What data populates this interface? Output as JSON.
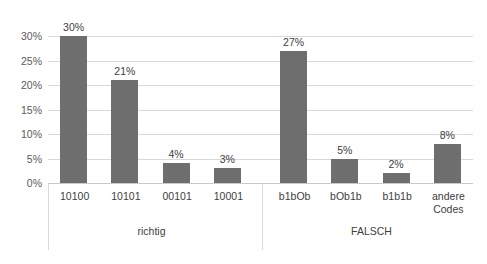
{
  "chart_data": {
    "type": "bar",
    "title": "",
    "subtitle": "",
    "xlabel": "",
    "ylabel": "",
    "ylim": [
      0,
      30
    ],
    "ytick_labels": [
      "0%",
      "5%",
      "10%",
      "15%",
      "20%",
      "25%",
      "30%"
    ],
    "ytick_values": [
      0,
      5,
      10,
      15,
      20,
      25,
      30
    ],
    "grid": true,
    "legend": false,
    "orientation": "vertical",
    "bar_color": "#6e6e6e",
    "gridline_color": "#d9d9d9",
    "categories": [
      "10100",
      "10101",
      "00101",
      "10001",
      "b1bOb",
      "bOb1b",
      "b1b1b",
      "andere Codes"
    ],
    "values": [
      30,
      21,
      4,
      3,
      27,
      5,
      2,
      8
    ],
    "data_labels": [
      "30%",
      "21%",
      "4%",
      "3%",
      "27%",
      "5%",
      "2%",
      "8%"
    ],
    "groups": [
      {
        "label": "richtig",
        "categories": [
          "10100",
          "10101",
          "00101",
          "10001"
        ]
      },
      {
        "label": "FALSCH",
        "categories": [
          "b1bOb",
          "bOb1b",
          "b1b1b",
          "andere Codes"
        ]
      }
    ],
    "bars": [
      {
        "category": "10100",
        "category_line1": "10100",
        "category_line2": "",
        "value": 30,
        "label": "30%",
        "group": "richtig"
      },
      {
        "category": "10101",
        "category_line1": "10101",
        "category_line2": "",
        "value": 21,
        "label": "21%",
        "group": "richtig"
      },
      {
        "category": "00101",
        "category_line1": "00101",
        "category_line2": "",
        "value": 4,
        "label": "4%",
        "group": "richtig"
      },
      {
        "category": "10001",
        "category_line1": "10001",
        "category_line2": "",
        "value": 3,
        "label": "3%",
        "group": "richtig"
      },
      {
        "category": "b1bOb",
        "category_line1": "b1bOb",
        "category_line2": "",
        "value": 27,
        "label": "27%",
        "group": "FALSCH"
      },
      {
        "category": "bOb1b",
        "category_line1": "bOb1b",
        "category_line2": "",
        "value": 5,
        "label": "5%",
        "group": "FALSCH"
      },
      {
        "category": "b1b1b",
        "category_line1": "b1b1b",
        "category_line2": "",
        "value": 2,
        "label": "2%",
        "group": "FALSCH"
      },
      {
        "category": "andere Codes",
        "category_line1": "andere",
        "category_line2": "Codes",
        "value": 8,
        "label": "8%",
        "group": "FALSCH"
      }
    ]
  }
}
